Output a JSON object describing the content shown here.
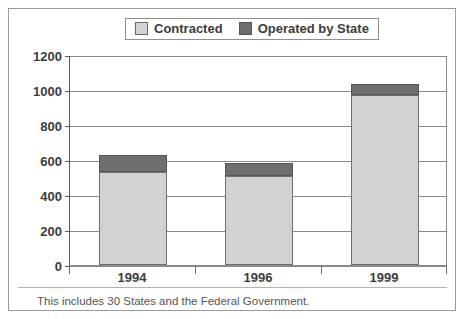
{
  "clipped_header_text": "",
  "legend": {
    "position": "top-center",
    "entries": [
      {
        "label": "Contracted",
        "color": "#d2d2d2",
        "swatch_name": "legend-swatch-contracted"
      },
      {
        "label": "Operated by State",
        "color": "#6e6e6e",
        "swatch_name": "legend-swatch-operated-by-state"
      }
    ]
  },
  "footnote": "This includes 30 States and the Federal Government.",
  "chart_data": {
    "type": "bar",
    "subtype": "stacked-vertical",
    "title": "",
    "xlabel": "",
    "ylabel": "",
    "categories": [
      "1994",
      "1996",
      "1999"
    ],
    "series": [
      {
        "name": "Contracted",
        "color": "#d2d2d2",
        "values": [
          530,
          508,
          970
        ]
      },
      {
        "name": "Operated by State",
        "color": "#6e6e6e",
        "values": [
          100,
          75,
          65
        ]
      }
    ],
    "totals": [
      630,
      583,
      1035
    ],
    "ylim": [
      0,
      1200
    ],
    "ytick_step": 200,
    "yticks": [
      0,
      200,
      400,
      600,
      800,
      1000,
      1200
    ],
    "ytick_labels": [
      "0",
      "200",
      "400",
      "600",
      "800",
      "1000",
      "1200"
    ],
    "grid": "horizontal",
    "legend_position": "top-center"
  }
}
